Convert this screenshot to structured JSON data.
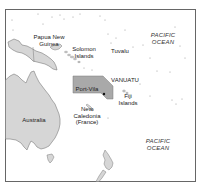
{
  "map": {
    "title": "",
    "colors": {
      "land": "#d6d6d6",
      "land_stroke": "#7a7a7a",
      "highlight": "#a9a9a9",
      "border": "#666666",
      "water": "#ffffff"
    },
    "labels": {
      "papua_new_guinea": "Papua New\nGuinea",
      "solomon_islands": "Solomon\nIslands",
      "tuvalu": "Tuvalu",
      "pacific_ocean_north": "PACIFIC\nOCEAN",
      "vanuatu": "VANUATU",
      "port_vila": "Port-Vila",
      "fiji_islands": "Fiji\nIslands",
      "australia": "Australia",
      "new_caledonia": "New\nCaledonia\n(France)",
      "pacific_ocean_south": "PACIFIC\nOCEAN"
    },
    "capital_marker": "port-vila-dot"
  }
}
